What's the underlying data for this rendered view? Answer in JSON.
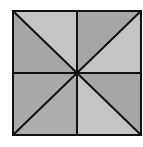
{
  "diagram": {
    "title": "",
    "shape": "square divided into 8 triangles by diagonals and midlines",
    "colors": {
      "background": "#ffffff",
      "stroke": "#111111",
      "light": "#c4c4c4",
      "dark": "#a4a4a4"
    },
    "square": {
      "x1": 13,
      "y1": 11,
      "x2": 141,
      "y2": 135
    },
    "triangles": [
      {
        "id": "top-left-upper",
        "shade": "light"
      },
      {
        "id": "top-left-lower",
        "shade": "dark"
      },
      {
        "id": "top-right-upper",
        "shade": "dark"
      },
      {
        "id": "top-right-lower",
        "shade": "light"
      },
      {
        "id": "bottom-left-upper",
        "shade": "dark"
      },
      {
        "id": "bottom-left-lower",
        "shade": "dark"
      },
      {
        "id": "bottom-right-upper",
        "shade": "dark"
      },
      {
        "id": "bottom-right-lower",
        "shade": "light"
      }
    ]
  }
}
